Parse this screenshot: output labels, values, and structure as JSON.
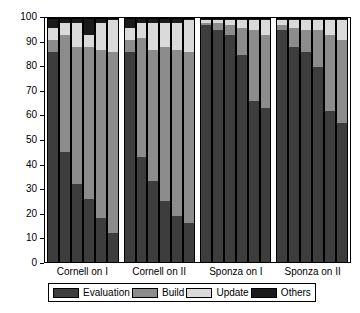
{
  "chart_data": {
    "type": "bar",
    "subtype": "stacked-100-percent-grouped",
    "title": "",
    "xlabel": "",
    "ylabel": "",
    "ylim": [
      0,
      100
    ],
    "ytick_step": 10,
    "grid": false,
    "legend_position": "bottom",
    "categories": [
      "Cornell on I",
      "Cornell on II",
      "Sponza on I",
      "Sponza on II"
    ],
    "bars_per_category": 6,
    "ytick_labels": [
      "0",
      "10",
      "20",
      "30",
      "40",
      "50",
      "60",
      "70",
      "80",
      "90",
      "100"
    ],
    "series": [
      {
        "name": "Evaluation",
        "color": "#3d3d3d",
        "values": [
          [
            86,
            45,
            32,
            26,
            18,
            12
          ],
          [
            86,
            43,
            33,
            25,
            19,
            16
          ],
          [
            97,
            95,
            93,
            85,
            66,
            63
          ],
          [
            95,
            88,
            86,
            80,
            62,
            57
          ]
        ]
      },
      {
        "name": "Build",
        "color": "#8c8c8c",
        "values": [
          [
            5,
            48,
            56,
            62,
            69,
            74
          ],
          [
            5,
            49,
            54,
            63,
            68,
            70
          ],
          [
            1,
            3,
            4,
            11,
            29,
            30
          ],
          [
            2,
            8,
            9,
            15,
            31,
            34
          ]
        ]
      },
      {
        "name": "Update",
        "color": "#dadada",
        "values": [
          [
            5,
            5,
            10,
            5,
            11,
            13
          ],
          [
            5,
            6,
            11,
            10,
            11,
            13
          ],
          [
            1,
            1,
            2,
            3,
            4,
            6
          ],
          [
            2,
            3,
            4,
            4,
            6,
            8
          ]
        ]
      },
      {
        "name": "Others",
        "color": "#1a1a1a",
        "values": [
          [
            4,
            2,
            2,
            7,
            2,
            1
          ],
          [
            4,
            2,
            2,
            2,
            2,
            1
          ],
          [
            1,
            1,
            1,
            1,
            1,
            1
          ],
          [
            1,
            1,
            1,
            1,
            1,
            1
          ]
        ]
      }
    ],
    "legend_entries": [
      {
        "label": "Evaluation",
        "color": "#3d3d3d"
      },
      {
        "label": "Build",
        "color": "#8c8c8c"
      },
      {
        "label": "Update",
        "color": "#dadada"
      },
      {
        "label": "Others",
        "color": "#1a1a1a"
      }
    ]
  }
}
